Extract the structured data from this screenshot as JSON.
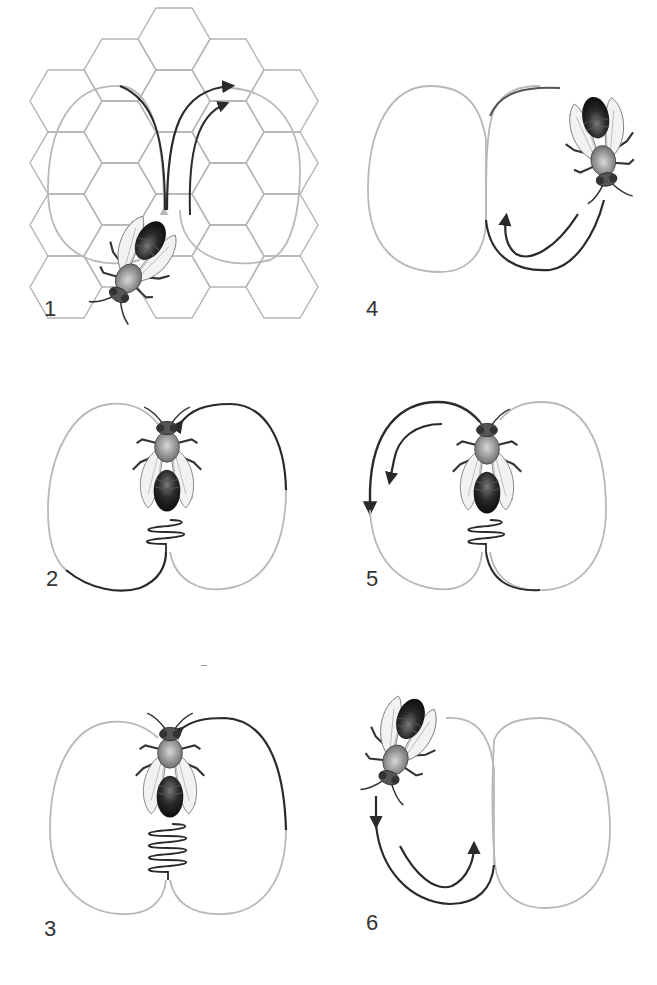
{
  "diagram": {
    "panels": [
      {
        "number": "1",
        "description": "Bee on honeycomb beginning dance; figure-eight path overlaid on hexagonal cells"
      },
      {
        "number": "2",
        "description": "Waggle run (short), then return loop to the left"
      },
      {
        "number": "3",
        "description": "Longer waggle run, then return loop to the right"
      },
      {
        "number": "4",
        "description": "Bee circling back along right loop"
      },
      {
        "number": "5",
        "description": "Waggle run, then return loop to the left"
      },
      {
        "number": "6",
        "description": "Bee circling back along left loop"
      }
    ]
  },
  "colors": {
    "path_active": "#2a2a2a",
    "path_faded": "#b8b8b8",
    "comb": "#a8a8a8",
    "label": "#333333",
    "bee_abdomen": "#1e1e1e",
    "bee_thorax": "#9a9a9a"
  }
}
